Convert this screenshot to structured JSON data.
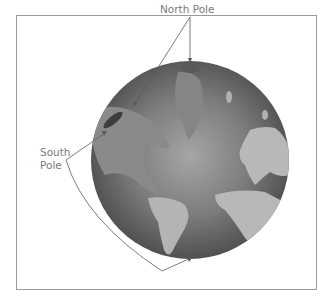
{
  "figure": {
    "labels": {
      "north": "North Pole",
      "south_line1": "South",
      "south_line2": "Pole"
    },
    "colors": {
      "frame": "#9a9a9a",
      "label_text": "#7a7a7a",
      "ocean_light": "#9c9c9c",
      "ocean_dark": "#4e4e4e",
      "land": "#b8b8b8",
      "leader_line": "#6a6a6a"
    }
  }
}
